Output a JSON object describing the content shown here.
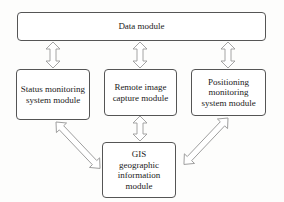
{
  "diagram": {
    "data_module": "Data module",
    "status_module": "Status monitoring system module",
    "remote_module": "Remote image capture module",
    "positioning_module": "Positioning monitoring system module",
    "gis_module": "GIS geographic information module"
  },
  "colors": {
    "box_border": "#555555",
    "arrow_stroke": "#9a9a9a",
    "arrow_fill": "#ffffff"
  }
}
